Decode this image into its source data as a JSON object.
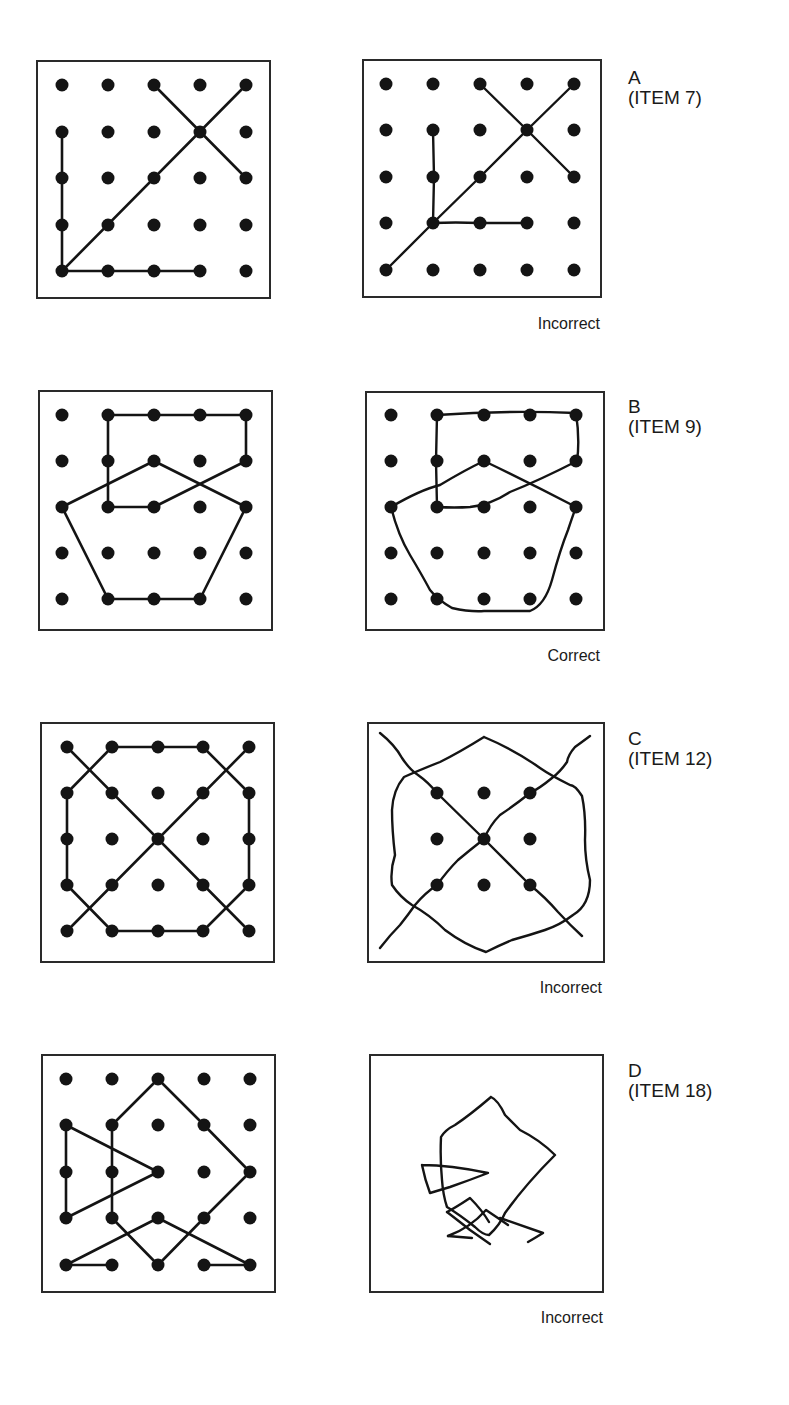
{
  "items": [
    {
      "letter": "A",
      "item": "(ITEM 7)",
      "verdict": "Incorrect",
      "label_pos": [
        628,
        68
      ],
      "verdict_pos": [
        480,
        315
      ],
      "model": {
        "box": [
          37,
          61,
          233,
          237
        ],
        "grid_x": [
          62,
          108,
          154,
          200,
          246
        ],
        "grid_y": [
          85,
          132,
          178,
          225,
          271
        ],
        "dots": "all",
        "segments": [
          [
            [
              62,
              132
            ],
            [
              62,
              271
            ]
          ],
          [
            [
              62,
              271
            ],
            [
              200,
              271
            ]
          ],
          [
            [
              62,
              271
            ],
            [
              246,
              85
            ]
          ],
          [
            [
              154,
              85
            ],
            [
              246,
              178
            ]
          ]
        ]
      },
      "copy": {
        "box": [
          363,
          60,
          238,
          237
        ],
        "grid_x": [
          386,
          433,
          480,
          527,
          574
        ],
        "grid_y": [
          84,
          130,
          177,
          223,
          270
        ],
        "dots": "all",
        "paths": [
          "M386,270 L433,223 L480,177 L527,130 L574,84",
          "M480,84 L527,130 L574,177",
          "M433,130 L434,177 L433,223",
          "M433,223 Q455,222 480,223 L527,223"
        ]
      }
    },
    {
      "letter": "B",
      "item": "(ITEM 9)",
      "verdict": "Correct",
      "label_pos": [
        628,
        397
      ],
      "verdict_pos": [
        480,
        647
      ],
      "model": {
        "box": [
          39,
          391,
          233,
          239
        ],
        "grid_x": [
          62,
          108,
          154,
          200,
          246
        ],
        "grid_y": [
          415,
          461,
          507,
          553,
          599
        ],
        "dots": "all",
        "segments": [
          [
            [
              108,
              415
            ],
            [
              246,
              415
            ]
          ],
          [
            [
              246,
              415
            ],
            [
              246,
              461
            ]
          ],
          [
            [
              246,
              461
            ],
            [
              154,
              507
            ]
          ],
          [
            [
              154,
              507
            ],
            [
              108,
              507
            ]
          ],
          [
            [
              108,
              507
            ],
            [
              108,
              415
            ]
          ],
          [
            [
              62,
              507
            ],
            [
              154,
              461
            ]
          ],
          [
            [
              154,
              461
            ],
            [
              246,
              507
            ]
          ],
          [
            [
              62,
              507
            ],
            [
              108,
              599
            ]
          ],
          [
            [
              108,
              599
            ],
            [
              200,
              599
            ]
          ],
          [
            [
              200,
              599
            ],
            [
              246,
              507
            ]
          ]
        ]
      },
      "copy": {
        "box": [
          366,
          392,
          238,
          238
        ],
        "grid_x": [
          391,
          437,
          484,
          530,
          576
        ],
        "grid_y": [
          415,
          461,
          507,
          553,
          599
        ],
        "dots": "all",
        "paths": [
          "M437,415 Q505,410 576,413 Q580,440 577,461 Q540,480 510,492 Q490,505 470,507 Q455,508 437,507 L436,461 L437,415",
          "M391,507 Q420,490 440,485 Q465,470 484,461 Q530,483 576,507",
          "M391,507 Q398,535 410,555 Q422,575 430,590 Q438,600 452,608 Q470,612 484,611 L530,611 Q545,605 552,580 Q560,550 568,530 Q573,515 576,507"
        ]
      }
    },
    {
      "letter": "C",
      "item": "(ITEM 12)",
      "verdict": "Incorrect",
      "label_pos": [
        628,
        729
      ],
      "verdict_pos": [
        482,
        979
      ],
      "model": {
        "box": [
          41,
          723,
          233,
          239
        ],
        "grid_x": [
          67,
          112,
          158,
          203,
          249
        ],
        "grid_y": [
          747,
          793,
          839,
          885,
          931
        ],
        "dots": "all",
        "segments": [
          [
            [
              112,
              747
            ],
            [
              203,
              747
            ]
          ],
          [
            [
              203,
              747
            ],
            [
              249,
              793
            ]
          ],
          [
            [
              249,
              793
            ],
            [
              249,
              885
            ]
          ],
          [
            [
              249,
              885
            ],
            [
              203,
              931
            ]
          ],
          [
            [
              203,
              931
            ],
            [
              112,
              931
            ]
          ],
          [
            [
              112,
              931
            ],
            [
              67,
              885
            ]
          ],
          [
            [
              67,
              885
            ],
            [
              67,
              793
            ]
          ],
          [
            [
              67,
              793
            ],
            [
              112,
              747
            ]
          ],
          [
            [
              67,
              747
            ],
            [
              249,
              931
            ]
          ],
          [
            [
              249,
              747
            ],
            [
              67,
              931
            ]
          ]
        ]
      },
      "copy": {
        "box": [
          368,
          723,
          236,
          239
        ],
        "grid_x": [
          391,
          437,
          484,
          530,
          576
        ],
        "grid_y": [
          747,
          793,
          839,
          885,
          931
        ],
        "dots": "inner",
        "paths": [
          "M380,733 Q395,745 402,758 Q410,770 418,775 Q428,782 437,793 L484,839 L530,885 Q545,897 558,912 Q570,925 582,936",
          "M590,736 Q582,742 575,747 Q568,755 567,762 Q560,772 552,778 Q540,788 530,793 Q515,805 500,815 Q490,825 484,839 Q470,850 458,860 Q448,870 437,885 Q425,893 415,905 Q408,915 400,925 Q390,935 380,948",
          "M484,737 Q460,752 440,762 Q420,770 404,777 Q393,790 392,810 Q392,830 395,855 Q390,870 392,885 Q400,897 412,905 Q430,915 445,930 Q465,945 486,952 Q500,945 512,940 Q530,935 545,930 Q560,925 573,915 Q590,905 590,880 Q585,860 585,840 Q586,815 582,796 Q575,785 570,785 Q550,775 540,768 Q515,750 484,737"
        ]
      }
    },
    {
      "letter": "D",
      "item": "(ITEM 18)",
      "verdict": "Incorrect",
      "label_pos": [
        628,
        1061
      ],
      "verdict_pos": [
        483,
        1309
      ],
      "model": {
        "box": [
          42,
          1055,
          233,
          237
        ],
        "grid_x": [
          66,
          112,
          158,
          204,
          250
        ],
        "grid_y": [
          1079,
          1125,
          1172,
          1218,
          1265
        ],
        "dots": "all",
        "segments": [
          [
            [
              66,
              1125
            ],
            [
              66,
              1218
            ]
          ],
          [
            [
              66,
              1125
            ],
            [
              158,
              1172
            ]
          ],
          [
            [
              158,
              1172
            ],
            [
              66,
              1218
            ]
          ],
          [
            [
              112,
              1125
            ],
            [
              112,
              1218
            ]
          ],
          [
            [
              112,
              1125
            ],
            [
              158,
              1079
            ]
          ],
          [
            [
              158,
              1079
            ],
            [
              204,
              1125
            ]
          ],
          [
            [
              204,
              1125
            ],
            [
              250,
              1172
            ]
          ],
          [
            [
              250,
              1172
            ],
            [
              204,
              1218
            ]
          ],
          [
            [
              204,
              1218
            ],
            [
              158,
              1265
            ]
          ],
          [
            [
              158,
              1265
            ],
            [
              112,
              1218
            ]
          ],
          [
            [
              66,
              1265
            ],
            [
              112,
              1265
            ]
          ],
          [
            [
              66,
              1265
            ],
            [
              158,
              1218
            ]
          ],
          [
            [
              158,
              1218
            ],
            [
              250,
              1265
            ]
          ],
          [
            [
              204,
              1265
            ],
            [
              250,
              1265
            ]
          ]
        ]
      },
      "copy": {
        "box": [
          370,
          1055,
          233,
          237
        ],
        "dots": "none",
        "paths": [
          "M491,1097 Q470,1115 455,1125 Q445,1130 441,1137 Q440,1160 442,1180 Q443,1195 447,1207 Q460,1215 475,1227 Q483,1235 489,1235 Q500,1225 505,1213 Q525,1185 555,1155 Q540,1140 520,1130 Q510,1120 505,1115 Q498,1100 491,1097",
          "M422,1165 Q450,1165 488,1173 Q470,1180 450,1187 Q440,1190 430,1193 Q425,1180 422,1165",
          "M447,1212 Q455,1208 470,1198 Q482,1210 489,1222",
          "M447,1212 Q460,1222 470,1230 Q480,1237 490,1244",
          "M448,1236 Q470,1228 486,1210 Q498,1218 508,1225",
          "M448,1236 L472,1238",
          "M500,1218 Q520,1225 543,1233 Q535,1238 528,1242"
        ]
      }
    }
  ],
  "style": {
    "ink_color": "#141414",
    "box_stroke": "#2a2a2a",
    "dot_radius": 6.5,
    "line_width": 2.6,
    "copy_line_width": 2.4
  }
}
